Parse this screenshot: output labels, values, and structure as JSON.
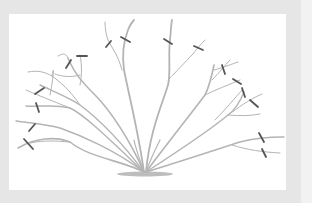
{
  "diagram": {
    "type": "pruning-illustration",
    "colors": {
      "outer_background": "#f2f2f2",
      "frame": "#e6e6e6",
      "panel": "#ffffff",
      "branch": "#b4b4b4",
      "cut_mark": "#555555",
      "ground_shadow": "#bdbdbd"
    },
    "cut_mark_count": 16
  }
}
